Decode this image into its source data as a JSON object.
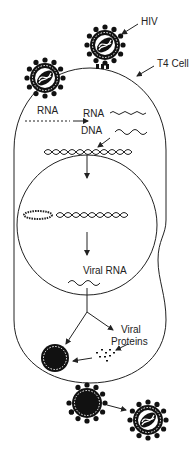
{
  "diagram": {
    "labels": {
      "hiv": "HIV",
      "t4_cell": "T4 Cell",
      "rna_entry": "RNA",
      "rna": "RNA",
      "dna": "DNA",
      "viral_rna": "Viral RNA",
      "viral_proteins_line1": "Viral",
      "viral_proteins_line2": "Proteins"
    },
    "colors": {
      "stroke": "#222222",
      "fill_dark": "#111111",
      "background": "#ffffff"
    }
  }
}
